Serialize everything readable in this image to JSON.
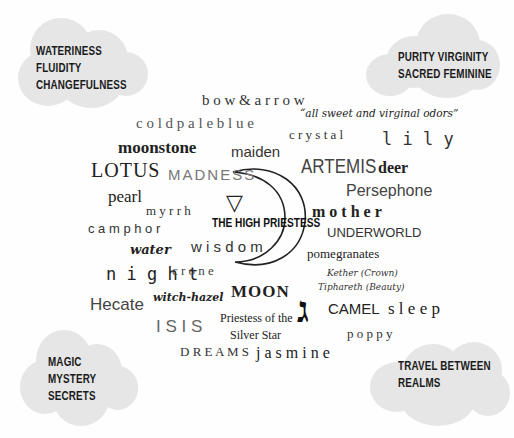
{
  "clouds": {
    "top_left": [
      "WATERINESS",
      "FLUIDITY",
      "CHANGEFULNESS"
    ],
    "top_right": [
      "PURITY VIRGINITY",
      "SACRED FEMININE"
    ],
    "bottom_left": [
      "MAGIC",
      "MYSTERY",
      "SECRETS"
    ],
    "bottom_right": [
      "TRAVEL BETWEEN",
      "REALMS"
    ]
  },
  "center": {
    "title": "THE HIGH PRIESTESS",
    "symbol": "▽",
    "hebrew_letter": "ג"
  },
  "words": {
    "bow_arrow": "b o w  &  a r r o w",
    "odors": "“all sweet and virginal odors”",
    "cold_pale_blue": "c o l d  p a l e  b l u e",
    "crystal": "c r y s t a l",
    "lily": "l i l y",
    "moonstone": "moonstone",
    "maiden": "maiden",
    "lotus": "LOTUS",
    "madness": "MADNESS",
    "artemis": "ARTEMIS",
    "deer": "deer",
    "persephone": "Persephone",
    "pearl": "pearl",
    "myrrh": "m y r r h",
    "mother": "m o t h e r",
    "camphor": "c a m p h o r",
    "underworld": "UNDERWORLD",
    "wisdom": "w i s d o m",
    "water": "water",
    "pomegranates": "pomegranates",
    "night": "n i g h t",
    "crone": "c r o n e",
    "kether": "Kether (Crown)",
    "tiphareth": "Tiphareth (Beauty)",
    "hecate": "Hecate",
    "witch_hazel": "witch-hazel",
    "moon": "MOON",
    "camel": "CAMEL",
    "sleep": "s l e e p",
    "isis": "I S I S",
    "priestess_silver_1": "Priestess of the",
    "priestess_silver_2": "Silver Star",
    "poppy": "p o p p y",
    "dreams": "D R E A M S",
    "jasmine": "j a s m i n e"
  }
}
